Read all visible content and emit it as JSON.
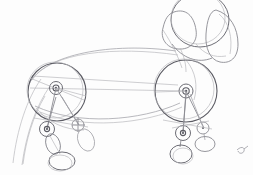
{
  "artwork": {
    "title": "Dachshund Construction Sketch",
    "medium": "graphite pencil on paper",
    "subject": "dachshund (wiener dog) side view",
    "stage": "construction / underdrawing",
    "canvas": {
      "width": 253,
      "height": 175,
      "background": "#fdfdfd"
    },
    "palette": {
      "paper": "#fdfdfd",
      "faint_line": "#b9b9bd",
      "light_line": "#a6a6ac",
      "mid_line": "#8b8b92",
      "dark_line": "#6d6d75",
      "darkest_line": "#5b5b63"
    }
  },
  "shapes": {
    "head": {
      "label": "head-cranium-oval",
      "note": "large rounded oval, top cropped by image edge",
      "cx": 200,
      "cy": 20,
      "rx": 29,
      "ry": 26
    },
    "muzzle": {
      "label": "muzzle-wedge",
      "note": "soft triangular wedge pointing left-down from head",
      "points": "172,13 190,10 196,42 176,48 163,34"
    },
    "ear": {
      "label": "ear-flap",
      "note": "long pendulous ear hanging along right side of head",
      "points": "212,14 232,22 238,48 228,62 212,58 206,36"
    },
    "cheek": {
      "label": "cheek-jaw-curve",
      "note": "curve joining muzzle to neck/chest",
      "path": "M 176,48 C 184,58 196,64 208,60"
    },
    "shoulder_circle": {
      "label": "front-shoulder-mass",
      "cx": 186,
      "cy": 91,
      "r": 31,
      "hub_r_outer": 7,
      "hub_r_inner": 3.2
    },
    "hip_circle": {
      "label": "rear-hip-mass",
      "cx": 57,
      "cy": 92,
      "r": 29,
      "hub_r_outer": 6.5,
      "hub_r_inner": 3.0
    },
    "topline": {
      "label": "back-topline",
      "path": "M 30,82 C 50,52 120,44 178,52"
    },
    "belly": {
      "label": "belly-underline",
      "path": "M 36,106 C 80,124 140,120 178,104"
    },
    "chest_connector": {
      "label": "chest-to-hip-axis",
      "path": "M 57,82 L 186,87"
    },
    "tail": {
      "label": "tail-taper",
      "path_upper": "M 40,80 C 26,100 16,130 12,162",
      "path_lower": "M 48,86 C 34,106 24,134 20,164"
    }
  },
  "legs": {
    "front_near": {
      "label": "front-near-leg",
      "knee": {
        "cx": 183,
        "cy": 133,
        "r": 7.5
      },
      "paw": {
        "cx": 182,
        "cy": 152,
        "rx": 11,
        "ry": 9
      },
      "upper_path": "M 186,95 L 183,133",
      "lower_path": "M 183,133 L 182,146"
    },
    "front_far": {
      "label": "front-far-leg",
      "knee": {
        "cx": 203,
        "cy": 128,
        "r": 6.0
      },
      "paw": {
        "cx": 205,
        "cy": 143,
        "rx": 10,
        "ry": 8
      },
      "upper_path": "M 190,94 L 203,128"
    },
    "rear_near": {
      "label": "rear-near-leg",
      "hock": {
        "cx": 47,
        "cy": 129,
        "r": 7.5
      },
      "shin": {
        "cx": 53,
        "cy": 143,
        "rx": 7,
        "ry": 10,
        "rotate": -18
      },
      "paw": {
        "cx": 62,
        "cy": 160,
        "rx": 13,
        "ry": 9
      },
      "upper_path": "M 57,98 L 47,129",
      "lower_path": "M 50,137 L 60,153"
    },
    "rear_far": {
      "label": "rear-far-leg",
      "hock": {
        "cx": 78,
        "cy": 125,
        "r": 6.0
      },
      "shin": {
        "cx": 85,
        "cy": 139,
        "rx": 8,
        "ry": 11,
        "rotate": -22
      },
      "upper_path": "M 62,97 L 78,125"
    }
  },
  "guides": {
    "label": "construction-guide-lines",
    "lines": [
      "M 57,92 L 47,129",
      "M 57,92 L 78,125",
      "M 186,91 L 183,133",
      "M 186,91 L 203,128",
      "M 28,88 L 186,91",
      "M 32,74 L 176,84",
      "M 160,120 L 212,128"
    ]
  },
  "signature": {
    "label": "corner-mark",
    "present": true,
    "x": 240,
    "y": 147,
    "note": "small faint graphite mark in lower-right corner"
  }
}
